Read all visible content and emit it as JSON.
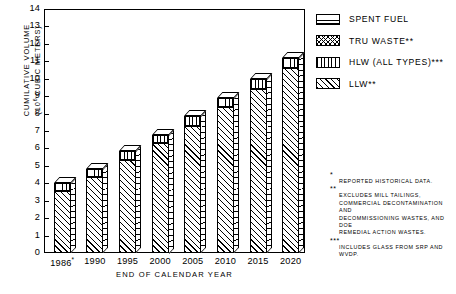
{
  "chart_data": {
    "type": "bar",
    "stacked": true,
    "title": "",
    "xlabel": "END OF CALENDAR YEAR",
    "ylabel": "CUMILATIVE VOLUME (10^6 CUBIC METERS)",
    "ylabel_line1": "CUMILATIVE  VOLUME",
    "ylabel_line2_prefix": "(10",
    "ylabel_line2_sup": "6",
    "ylabel_line2_suffix": " CUBIC METERS)",
    "categories": [
      "1986*",
      "1990",
      "1995",
      "2000",
      "2005",
      "2010",
      "2015",
      "2020"
    ],
    "ylim": [
      0,
      14
    ],
    "yticks": [
      0,
      1,
      2,
      3,
      4,
      5,
      6,
      7,
      8,
      9,
      10,
      11,
      12,
      13,
      14
    ],
    "grid": false,
    "legend_position": "right-top",
    "series": [
      {
        "name": "LLW**",
        "pattern": "diagonal",
        "values": [
          3.55,
          4.35,
          5.35,
          6.3,
          7.3,
          8.35,
          9.4,
          10.6
        ]
      },
      {
        "name": "HLW (ALL TYPES)***",
        "pattern": "vertical",
        "values": [
          0.45,
          0.45,
          0.5,
          0.5,
          0.55,
          0.55,
          0.6,
          0.6
        ]
      },
      {
        "name": "TRU WASTE**",
        "pattern": "crosshatch",
        "values": [
          0,
          0,
          0,
          0,
          0,
          0,
          0,
          0
        ]
      },
      {
        "name": "SPENT FUEL",
        "pattern": "horizontal",
        "values": [
          0,
          0,
          0,
          0,
          0,
          0,
          0,
          0
        ]
      }
    ],
    "totals": [
      4.0,
      4.8,
      5.85,
      6.8,
      7.85,
      8.9,
      10.0,
      11.2
    ]
  },
  "legend": {
    "items": [
      {
        "label": "SPENT FUEL",
        "pattern": "horizontal"
      },
      {
        "label": "TRU WASTE**",
        "pattern": "crosshatch"
      },
      {
        "label": "HLW (ALL TYPES)***",
        "pattern": "vertical"
      },
      {
        "label": "LLW**",
        "pattern": "diagonal"
      }
    ]
  },
  "footnotes": [
    {
      "marker": "*",
      "lines": [
        "REPORTED  HISTORICAL  DATA."
      ]
    },
    {
      "marker": "**",
      "lines": [
        "EXCLUDES    MILL    TAILINGS,",
        "COMMERCIAL  DECONTAMINATION  AND",
        "DECOMMISSIONING  WASTES,  AND  DOE",
        "REMEDIAL  ACTION  WASTES."
      ]
    },
    {
      "marker": "***",
      "lines": [
        "INCLUDES  GLASS  FROM  SRP  AND  WVDP."
      ]
    }
  ]
}
